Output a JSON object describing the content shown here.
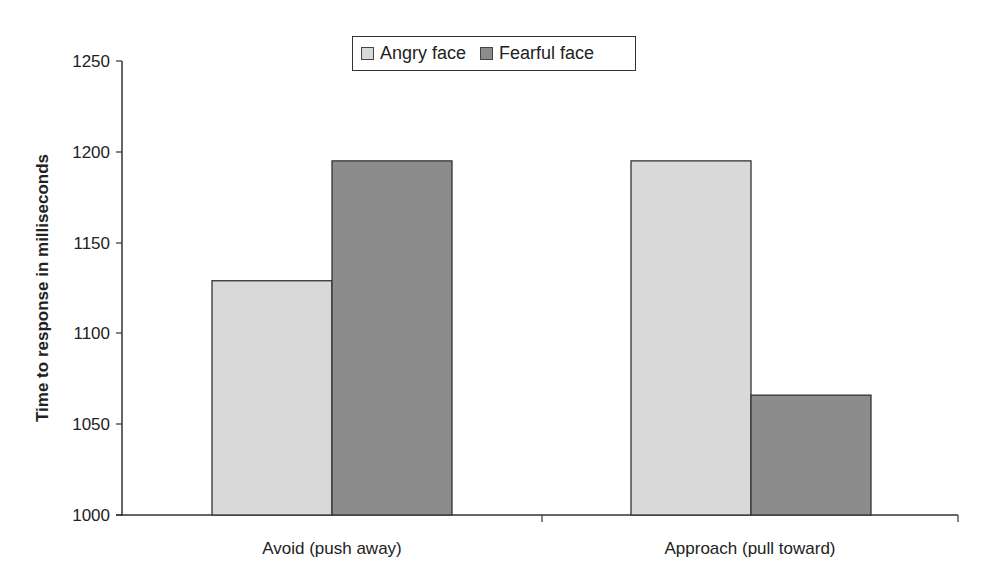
{
  "chart_data": {
    "type": "bar",
    "title": "",
    "xlabel": "",
    "ylabel": "Time to response in milliseconds",
    "ylim": [
      1000,
      1250
    ],
    "yticks": [
      1000,
      1050,
      1100,
      1150,
      1200,
      1250
    ],
    "categories": [
      "Avoid (push away)",
      "Approach (pull toward)"
    ],
    "series": [
      {
        "name": "Angry face",
        "color": "#d9d9d9",
        "values": [
          1129,
          1195
        ]
      },
      {
        "name": "Fearful face",
        "color": "#8c8c8c",
        "values": [
          1195,
          1066
        ]
      }
    ],
    "grid": false,
    "legend_position": "top-center"
  },
  "legend": {
    "items": [
      {
        "label": "Angry face",
        "color": "#d9d9d9"
      },
      {
        "label": "Fearful face",
        "color": "#8c8c8c"
      }
    ]
  },
  "axis": {
    "y_title": "Time to response in milliseconds",
    "y_tick_labels": [
      "1250",
      "1200",
      "1150",
      "1100",
      "1050",
      "1000"
    ],
    "x_labels": [
      "Avoid (push away)",
      "Approach (pull toward)"
    ]
  }
}
